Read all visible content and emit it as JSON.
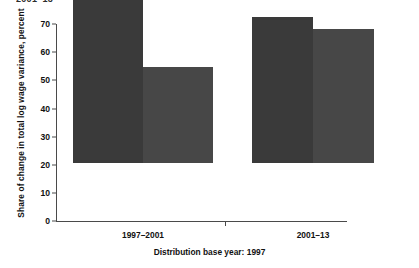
{
  "top_clipped_text": "2001–13",
  "caption": "Distribution base year: 1997",
  "axis": {
    "y_title": "Share of change in total log wage variance, percent",
    "y_ticks": [
      "0",
      "10",
      "20",
      "30",
      "40",
      "50",
      "60",
      "70"
    ],
    "x_labels": [
      "1997–2001",
      "2001–13"
    ]
  },
  "chart_data": {
    "type": "bar",
    "title": "",
    "subtitle": "",
    "xlabel": "",
    "ylabel": "Share of change in total log wage variance, percent",
    "categories": [
      "1997–2001",
      "2001–13"
    ],
    "series": [
      {
        "name": "series-1",
        "values": [
          65.5,
          52.0
        ],
        "color": "#3a3a3a"
      },
      {
        "name": "series-2",
        "values": [
          34.0,
          47.5
        ],
        "color": "#474747"
      }
    ],
    "ylim": [
      0,
      70
    ],
    "ytick_step": 10,
    "grid": false,
    "legend": false,
    "annotation": "Distribution base year: 1997"
  },
  "colors": {
    "bar_dark": "#3a3a3a",
    "bar_light": "#474747",
    "axis": "#4a4a4a",
    "background": "#ffffff"
  }
}
